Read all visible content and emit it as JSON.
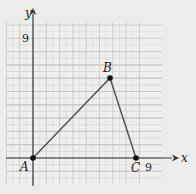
{
  "diagram": {
    "type": "coordinate-plane-triangle",
    "axes": {
      "x_label": "x",
      "y_label": "y",
      "x_tick_label": "9",
      "y_tick_label": "9"
    },
    "points": [
      {
        "label": "A",
        "x": 0,
        "y": 0
      },
      {
        "label": "B",
        "x": 6,
        "y": 6
      },
      {
        "label": "C",
        "x": 8,
        "y": 0
      }
    ],
    "colors": {
      "background": "#ececea",
      "grid_minor": "#d6d6d4",
      "grid_major": "#c4c4c2",
      "axis": "#3a3a3a",
      "segment": "#555555",
      "point": "#111111"
    }
  }
}
